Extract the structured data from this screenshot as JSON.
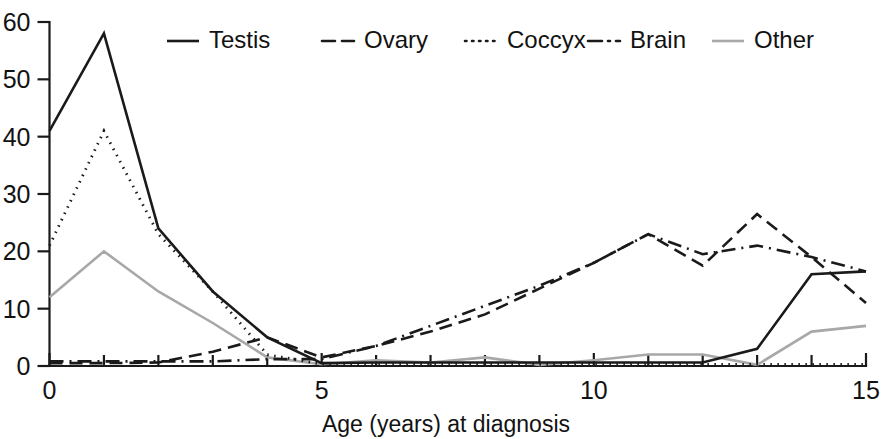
{
  "chart_data": {
    "type": "line",
    "title": "",
    "subtitle": "",
    "xlabel": "Age (years) at diagnosis",
    "ylabel": "",
    "xlim": [
      0,
      15
    ],
    "ylim": [
      0,
      60
    ],
    "xticks": [
      0,
      5,
      10,
      15
    ],
    "xtick_labels": [
      "0",
      "5",
      "10",
      "15"
    ],
    "yticks": [
      0,
      10,
      20,
      30,
      40,
      50,
      60
    ],
    "ytick_labels": [
      "0",
      "10",
      "20",
      "30",
      "40",
      "50",
      "60"
    ],
    "minor_xticks": [
      1,
      2,
      3,
      4,
      6,
      7,
      8,
      9,
      11,
      12,
      13,
      14
    ],
    "grid": false,
    "legend_position": "top",
    "x": [
      0,
      1,
      2,
      3,
      4,
      5,
      6,
      7,
      8,
      9,
      10,
      11,
      12,
      13,
      14,
      15
    ],
    "series": [
      {
        "name": "Testis",
        "dash": "solid",
        "color": "#1a1a1a",
        "width": 2.6,
        "values": [
          41,
          58,
          24,
          13,
          5,
          0.5,
          0.6,
          0.6,
          0.6,
          0.6,
          0.6,
          0.6,
          0.6,
          3,
          16,
          16.5
        ]
      },
      {
        "name": "Ovary",
        "dash": "dashed",
        "color": "#1a1a1a",
        "width": 2.6,
        "values": [
          0.5,
          0.5,
          0.6,
          2.5,
          5,
          1.5,
          3.5,
          6,
          9,
          13.5,
          18,
          23,
          17.5,
          26.5,
          19,
          11
        ]
      },
      {
        "name": "Coccyx",
        "dash": "dotted",
        "color": "#1a1a1a",
        "width": 2.8,
        "values": [
          21,
          41,
          23,
          13,
          2,
          0.3,
          0.3,
          0.3,
          0.3,
          0.3,
          0.3,
          0.3,
          0.3,
          0.3,
          0.3,
          0.3
        ]
      },
      {
        "name": "Brain",
        "dash": "dashdot",
        "color": "#1a1a1a",
        "width": 2.6,
        "values": [
          0.8,
          0.8,
          0.8,
          0.8,
          1.2,
          1.2,
          3.5,
          7,
          10.5,
          14,
          18,
          23,
          19.5,
          21,
          19,
          16.5
        ]
      },
      {
        "name": "Other",
        "dash": "solid",
        "color": "#a8a8a8",
        "width": 2.6,
        "values": [
          12,
          20,
          13,
          7.5,
          1.5,
          0.3,
          1,
          0.6,
          1.5,
          0.2,
          1,
          2,
          2,
          0.2,
          6,
          7
        ]
      }
    ],
    "legend": [
      {
        "label": "Testis",
        "dash": "solid",
        "color": "#1a1a1a"
      },
      {
        "label": "Ovary",
        "dash": "dashed",
        "color": "#1a1a1a"
      },
      {
        "label": "Coccyx",
        "dash": "dotted",
        "color": "#1a1a1a"
      },
      {
        "label": "Brain",
        "dash": "dashdot",
        "color": "#1a1a1a"
      },
      {
        "label": "Other",
        "dash": "solid",
        "color": "#a8a8a8"
      }
    ]
  },
  "axes": {
    "x_title": "Age (years) at diagnosis"
  }
}
